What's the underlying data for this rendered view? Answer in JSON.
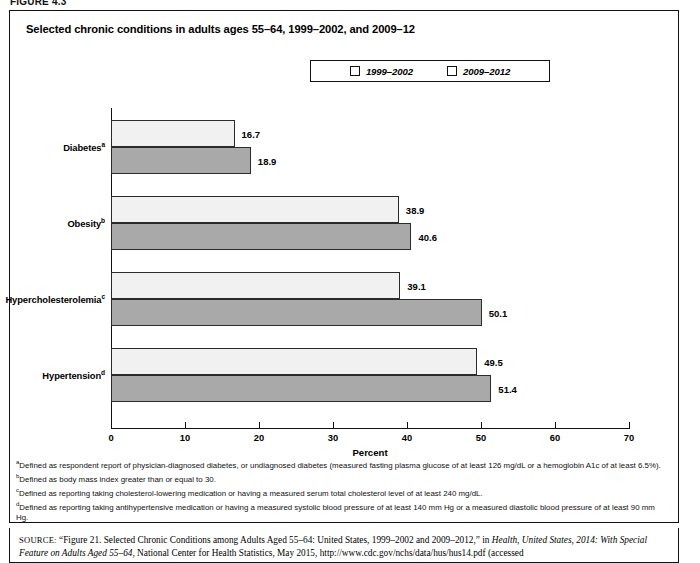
{
  "figure_label": "FIGURE 4.3",
  "chart_title": "Selected chronic conditions in adults ages 55–64, 1999–2002, and 2009–12",
  "legend": {
    "items": [
      {
        "label": "1999–2002",
        "swatch": "legend-swatch-light",
        "color": "#f1f1f1"
      },
      {
        "label": "2009–2012",
        "swatch": "legend-swatch-dark",
        "color": "#a9a9a9"
      }
    ]
  },
  "axis": {
    "x_title": "Percent",
    "ticks": [
      "0",
      "10",
      "20",
      "30",
      "40",
      "50",
      "60",
      "70"
    ]
  },
  "footnotes": [
    {
      "marker": "a",
      "text": "Defined as respondent report of physician-diagnosed diabetes, or undiagnosed diabetes (measured fasting plasma glucose of at least 126 mg/dL or a hemoglobin A1c of at least 6.5%)."
    },
    {
      "marker": "b",
      "text": "Defined as body mass index greater than or equal to 30."
    },
    {
      "marker": "c",
      "text": "Defined as reporting taking cholesterol-lowering medication or having a measured serum total cholesterol level of at least 240 mg/dL."
    },
    {
      "marker": "d",
      "text": "Defined as reporting taking antihypertensive medication or having a measured systolic blood pressure of at least 140 mm Hg or a measured diastolic blood pressure of at least 90 mm Hg."
    }
  ],
  "source": {
    "label": "SOURCE:",
    "part1": " “Figure 21. Selected Chronic Conditions among Adults Aged 55–64: United States, 1999–2002 and 2009–2012,” in ",
    "italic1": "Health, United States, 2014: With Special Feature on Adults Aged 55–64",
    "part2": ", National Center for Health Statistics, May 2015, http://www.cdc.gov/nchs/data/hus/hus14.pdf (accessed"
  },
  "chart_data": {
    "type": "bar",
    "orientation": "horizontal",
    "title": "Selected chronic conditions in adults ages 55–64, 1999–2002, and 2009–12",
    "xlabel": "Percent",
    "ylabel": "",
    "xlim": [
      0,
      70
    ],
    "xticks": [
      0,
      10,
      20,
      30,
      40,
      50,
      60,
      70
    ],
    "grid": false,
    "legend_position": "top-center",
    "categories": [
      "Diabetes",
      "Obesity",
      "Hypercholesterolemia",
      "Hypertension"
    ],
    "category_markers": [
      "a",
      "b",
      "c",
      "d"
    ],
    "series": [
      {
        "name": "1999–2002",
        "color": "#f1f1f1",
        "values": [
          16.7,
          38.9,
          39.1,
          49.5
        ]
      },
      {
        "name": "2009–2012",
        "color": "#a9a9a9",
        "values": [
          18.9,
          40.6,
          50.1,
          51.4
        ]
      }
    ]
  }
}
